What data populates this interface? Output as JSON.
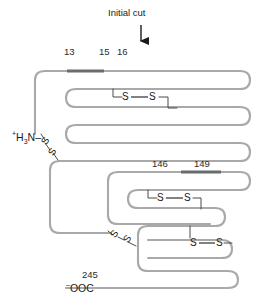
{
  "figure": {
    "type": "protein-disulfide-diagram",
    "title": "Initial cut",
    "arrow": "down-arrow-icon",
    "chain_color": "#a9a9a9",
    "highlight_color": "#6b6b6b",
    "text_color": "#1a1a1a",
    "background": "#ffffff"
  },
  "annotations": {
    "initial_cut_label": "Initial cut",
    "residue_13": "13",
    "residue_15": "15",
    "residue_16": "16",
    "residue_146": "146",
    "residue_149": "149",
    "residue_245": "245",
    "n_terminus": "H",
    "n_terminus_charge": "+",
    "n_terminus_sub": "3",
    "n_terminus_tail": "N–",
    "c_terminus_charge": "–",
    "c_terminus": "OOC"
  },
  "disulfide_bonds": [
    {
      "id": "bond-1",
      "label_left": "S",
      "label_right": "S",
      "dash": "—",
      "orientation": "horizontal",
      "region": "upper"
    },
    {
      "id": "bond-2",
      "label_left": "S",
      "label_right": "S",
      "dash": "—",
      "orientation": "diagonal",
      "region": "n-terminal"
    },
    {
      "id": "bond-3",
      "label_left": "S",
      "label_right": "S",
      "dash": "—",
      "orientation": "horizontal",
      "region": "middle"
    },
    {
      "id": "bond-4",
      "label_left": "S",
      "label_right": "S",
      "dash": "—",
      "orientation": "diagonal",
      "region": "lower-left"
    },
    {
      "id": "bond-5",
      "label_left": "S",
      "label_right": "S",
      "dash": "—",
      "orientation": "horizontal",
      "region": "lower-right"
    }
  ],
  "cleavage_segments": [
    {
      "id": "segment-upper",
      "from": "13",
      "to": "15",
      "color": "#6b6b6b"
    },
    {
      "id": "segment-lower",
      "from": "146",
      "to": "149",
      "color": "#6b6b6b"
    }
  ]
}
